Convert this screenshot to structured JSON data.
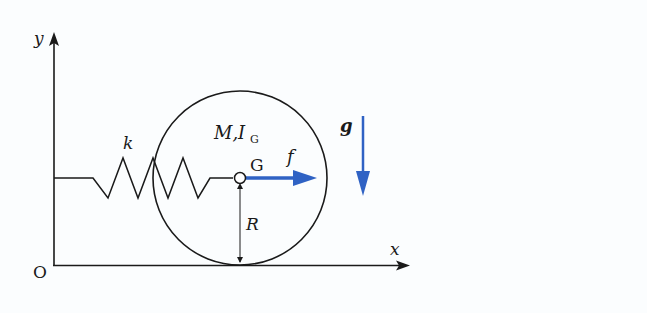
{
  "diagram": {
    "type": "mechanics-free-body",
    "axes": {
      "x_label": "x",
      "y_label": "y",
      "origin_label": "O"
    },
    "spring": {
      "label": "k"
    },
    "body": {
      "mass_label": "M,",
      "inertia_label": "I",
      "inertia_subscript": "G",
      "center_label": "G",
      "radius_label": "R"
    },
    "forces": {
      "applied_label": "f",
      "gravity_label": "g"
    },
    "colors": {
      "line": "#1a1a1a",
      "force_arrow": "#2f62c4",
      "background": "#fbfdfe"
    }
  }
}
